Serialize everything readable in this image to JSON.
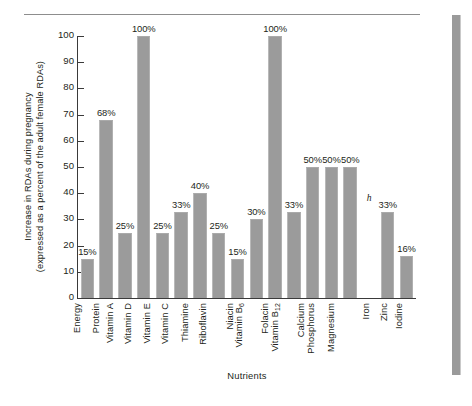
{
  "chart_data": {
    "type": "bar",
    "title": "",
    "xlabel": "Nutrients",
    "ylabel_line1": "Increase in RDAs during pregnancy",
    "ylabel_line2": "(expressed as a percent of the adult female RDAs)",
    "ylim": [
      0,
      100
    ],
    "yticks": [
      100,
      90,
      80,
      70,
      60,
      50,
      40,
      30,
      20,
      10,
      0
    ],
    "grid": false,
    "legend": "none",
    "bar_color": "#9b9b9b",
    "categories": [
      "Energy",
      "Protein",
      "Vitamin A",
      "Vitamin D",
      "Vitamin E",
      "Vitamin C",
      "Thiamine",
      "Riboflavin",
      "Niacin",
      "Vitamin B6",
      "Folacin",
      "Vitamin B12",
      "Calcium",
      "Phosphorus",
      "Magnesium",
      "Iron",
      "Zinc",
      "Iodine"
    ],
    "values": [
      15,
      68,
      25,
      100,
      25,
      33,
      40,
      25,
      15,
      30,
      100,
      33,
      50,
      50,
      50,
      null,
      33,
      16
    ],
    "data_labels": [
      "15%",
      "68%",
      "25%",
      "100%",
      "25%",
      "33%",
      "40%",
      "25%",
      "15%",
      "30%",
      "100%",
      "33%",
      "50%",
      "50%",
      "50%",
      "",
      "33%",
      "16%"
    ],
    "annotations": [
      {
        "category": "Iron",
        "text": "h",
        "note": "footnote marker shown in place of a bar"
      }
    ]
  },
  "axis_labels": {
    "categories_display": [
      "Energy",
      "Protein",
      "Vitamin A",
      "Vitamin D",
      "Vitamin E",
      "Vitamin C",
      "Thiamine",
      "Riboflavin",
      "Niacin",
      "Vitamin B",
      "Folacin",
      "Vitamin B",
      "Calcium",
      "Phosphorus",
      "Magnesium",
      "Iron",
      "Zinc",
      "Iodine"
    ],
    "category_subscripts": [
      "",
      "",
      "",
      "",
      "",
      "",
      "",
      "",
      "",
      "6",
      "",
      "12",
      "",
      "",
      "",
      "",
      "",
      ""
    ]
  }
}
